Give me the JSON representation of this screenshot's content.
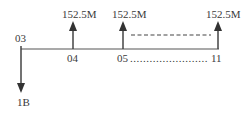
{
  "diagram": {
    "type": "cash-flow-timeline",
    "colors": {
      "line": "#555555",
      "arrow": "#333333",
      "text": "#3a3a3a",
      "background": "#ffffff"
    },
    "start": {
      "period_label": "03",
      "flow_label": "1B",
      "direction": "down"
    },
    "periods": [
      {
        "label": "04",
        "flow_label": "152.5M",
        "direction": "up"
      },
      {
        "label": "05",
        "flow_label": "152.5M",
        "direction": "up"
      },
      {
        "label": "11",
        "flow_label": "152.5M",
        "direction": "up"
      }
    ],
    "range_label": "05……………………11",
    "range_dots": "........................",
    "continuation": "dashed line between 05 and 11"
  }
}
